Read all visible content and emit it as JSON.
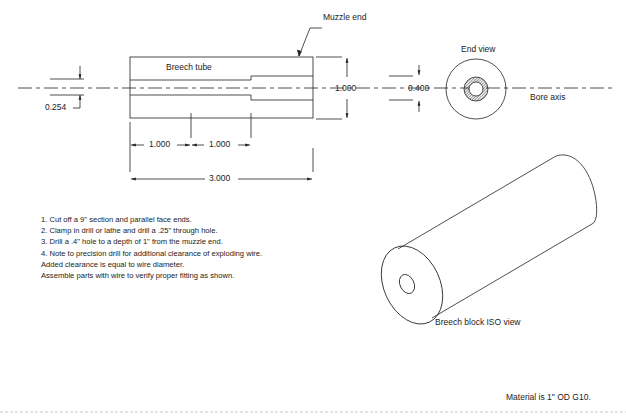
{
  "drawing": {
    "labels": {
      "muzzle_end": "Muzzle end",
      "breech_tube": "Breech tube",
      "end_view": "End view",
      "bore_axis": "Bore axis",
      "iso_view": "Breech block ISO view",
      "material": "Material is 1\" OD G10."
    },
    "dimensions": {
      "bore_dia": "0.254",
      "outer_dia": "1.000",
      "counterbore_dia": "0.400",
      "seg1_length": "1.000",
      "seg2_length": "1.000",
      "total_length": "3.000"
    },
    "notes": [
      "1. Cut off a 9\" section and parallel face ends.",
      "2. Clamp in drill or lathe and drill a .25\" through hole.",
      "3. Drill a .4\" hole to a depth of 1\" from the muzzle end.",
      "4. Note to precision drill for additional clearance of exploding wire.",
      "Added clearance is equal to wire diameter.",
      "Assemble parts with wire to verify proper fitting as shown."
    ],
    "colors": {
      "line": "#222222",
      "background": "#ffffff"
    }
  }
}
